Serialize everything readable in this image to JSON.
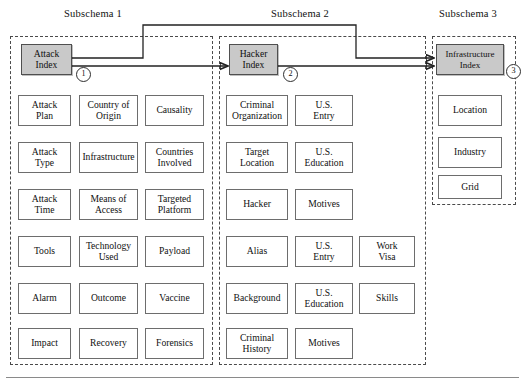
{
  "diagram": {
    "title_visible": false,
    "bottom_rule": true,
    "columns": [
      {
        "id": "subschema-1",
        "header": "Subschema 1",
        "marker": "1",
        "index_box": "Attack\nIndex",
        "attributes": [
          "Attack\nPlan",
          "Country of\nOrigin",
          "Causality",
          "Attack\nType",
          "Infrastructure",
          "Countries\nInvolved",
          "Attack\nTime",
          "Means of\nAccess",
          "Targeted\nPlatform",
          "Tools",
          "Technology\nUsed",
          "Payload",
          "Alarm",
          "Outcome",
          "Vaccine",
          "Impact",
          "Recovery",
          "Forensics"
        ]
      },
      {
        "id": "subschema-2",
        "header": "Subschema 2",
        "marker": "2",
        "index_box": "Hacker\nIndex",
        "attributes": [
          "Criminal\nOrganization",
          "U.S.\nEntry",
          "",
          "Target\nLocation",
          "U.S.\nEducation",
          "",
          "Hacker",
          "Motives",
          "",
          "Alias",
          "U.S.\nEntry",
          "Work\nVisa",
          "Background",
          "U.S.\nEducation",
          "Skills",
          "Criminal\nHistory",
          "Motives",
          ""
        ]
      },
      {
        "id": "subschema-3",
        "header": "Subschema 3",
        "marker": "3",
        "index_box": "Infrastructure\nIndex",
        "attributes": [
          "Location",
          "Industry",
          "Grid"
        ]
      }
    ],
    "connections": [
      {
        "from": "attack-index",
        "to": "hacker-index",
        "style": "elbow-up"
      },
      {
        "from": "attack-index",
        "to": "infrastructure-index",
        "style": "straight"
      },
      {
        "from": "hacker-index",
        "to": "infrastructure-index",
        "style": "straight"
      }
    ],
    "colors": {
      "index_fill": "#c9c9c9",
      "box_border": "#6d6d6d",
      "schema_border": "#4a4a4a",
      "line": "#222222"
    }
  }
}
